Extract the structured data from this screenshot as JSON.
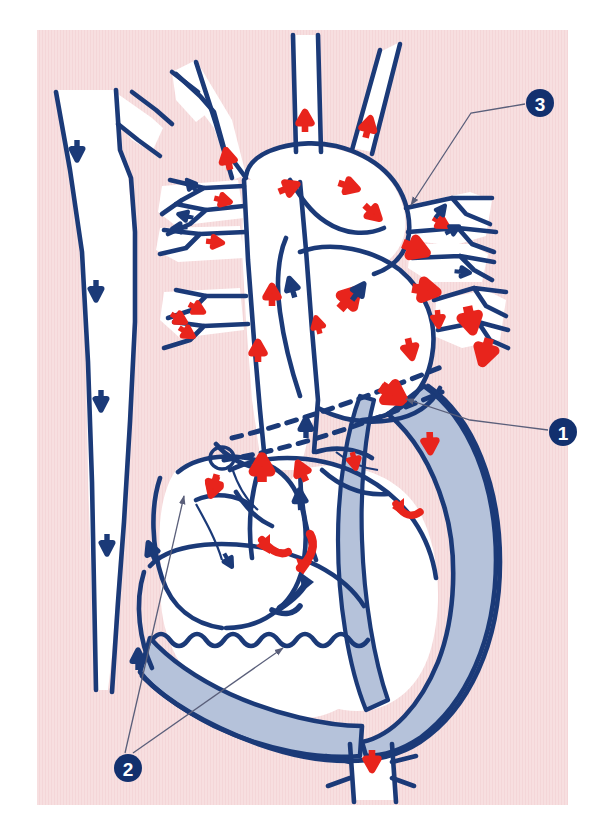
{
  "figure": {
    "kind": "anatomical-diagram",
    "panel": {
      "background_color": "#f7dfe0",
      "page_color": "#ffffff",
      "x": 37,
      "y": 30,
      "width": 531,
      "height": 775
    },
    "palette": {
      "outline_navy": "#1b3a78",
      "arrow_red": "#e8241c",
      "arrow_navy": "#1b3a78",
      "myocardium_fill": "#b5c2da",
      "lumen_fill": "#ffffff",
      "leader_line": "#5a5f7a",
      "callout_fill": "#12306e",
      "callout_text": "#ffffff"
    }
  },
  "callouts": [
    {
      "id": "callout-1",
      "label": "1",
      "cx": 563,
      "cy": 432,
      "r": 14,
      "leader": "558,432 470,420 406,399",
      "arrow_at": "406,399"
    },
    {
      "id": "callout-2",
      "label": "2",
      "cx": 128,
      "cy": 768,
      "r": 14,
      "leader_a": "125,753 184,496",
      "leader_b": "133,753 283,648",
      "arrow_a": "184,496",
      "arrow_b": "283,648"
    },
    {
      "id": "callout-3",
      "label": "3",
      "cx": 540,
      "cy": 103,
      "r": 14,
      "leader": "525,104 471,113 411,205",
      "arrow_at": "411,205"
    }
  ],
  "legend": {
    "red_flow": "oxygenated blood flow",
    "navy_flow": "deoxygenated blood flow"
  },
  "flow_arrows": {
    "red_count": 34,
    "navy_count": 17
  }
}
